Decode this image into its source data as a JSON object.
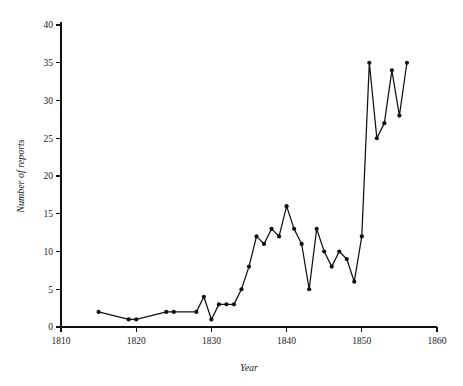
{
  "chart_data": {
    "type": "line",
    "title": "",
    "xlabel": "Year",
    "ylabel": "Number of reports",
    "xlim": [
      1810,
      1860
    ],
    "ylim": [
      0,
      40
    ],
    "grid": false,
    "legend": null,
    "marker": "filled-circle",
    "line_color": "#111111",
    "xticks": [
      1810,
      1820,
      1830,
      1840,
      1850,
      1860
    ],
    "xtick_labels": [
      "1810",
      "1820",
      "1830",
      "1840",
      "1850",
      "1860"
    ],
    "yticks": [
      0,
      5,
      10,
      15,
      20,
      25,
      30,
      35,
      40
    ],
    "ytick_labels": [
      "0",
      "5",
      "10",
      "15",
      "20",
      "25",
      "30",
      "35",
      "40"
    ],
    "x": [
      1815,
      1819,
      1820,
      1824,
      1825,
      1828,
      1829,
      1830,
      1831,
      1832,
      1833,
      1834,
      1835,
      1836,
      1837,
      1838,
      1839,
      1840,
      1841,
      1842,
      1843,
      1844,
      1845,
      1846,
      1847,
      1848,
      1849,
      1850,
      1851,
      1852,
      1853,
      1854,
      1855,
      1856
    ],
    "values": [
      2,
      1,
      1,
      2,
      2,
      2,
      4,
      1,
      3,
      3,
      3,
      5,
      8,
      12,
      11,
      13,
      12,
      16,
      13,
      11,
      5,
      13,
      10,
      8,
      10,
      9,
      6,
      12,
      35,
      25,
      27,
      34,
      28,
      35
    ],
    "points": [
      {
        "x": 1815,
        "y": 2
      },
      {
        "x": 1819,
        "y": 1
      },
      {
        "x": 1820,
        "y": 1
      },
      {
        "x": 1824,
        "y": 2
      },
      {
        "x": 1825,
        "y": 2
      },
      {
        "x": 1828,
        "y": 2
      },
      {
        "x": 1829,
        "y": 4
      },
      {
        "x": 1830,
        "y": 1
      },
      {
        "x": 1831,
        "y": 3
      },
      {
        "x": 1832,
        "y": 3
      },
      {
        "x": 1833,
        "y": 3
      },
      {
        "x": 1834,
        "y": 5
      },
      {
        "x": 1835,
        "y": 8
      },
      {
        "x": 1836,
        "y": 12
      },
      {
        "x": 1837,
        "y": 11
      },
      {
        "x": 1838,
        "y": 13
      },
      {
        "x": 1839,
        "y": 12
      },
      {
        "x": 1840,
        "y": 16
      },
      {
        "x": 1841,
        "y": 13
      },
      {
        "x": 1842,
        "y": 11
      },
      {
        "x": 1843,
        "y": 5
      },
      {
        "x": 1844,
        "y": 13
      },
      {
        "x": 1845,
        "y": 10
      },
      {
        "x": 1846,
        "y": 8
      },
      {
        "x": 1847,
        "y": 10
      },
      {
        "x": 1848,
        "y": 9
      },
      {
        "x": 1849,
        "y": 6
      },
      {
        "x": 1850,
        "y": 12
      },
      {
        "x": 1851,
        "y": 35
      },
      {
        "x": 1852,
        "y": 25
      },
      {
        "x": 1853,
        "y": 27
      },
      {
        "x": 1854,
        "y": 34
      },
      {
        "x": 1855,
        "y": 28
      },
      {
        "x": 1856,
        "y": 35
      }
    ]
  }
}
